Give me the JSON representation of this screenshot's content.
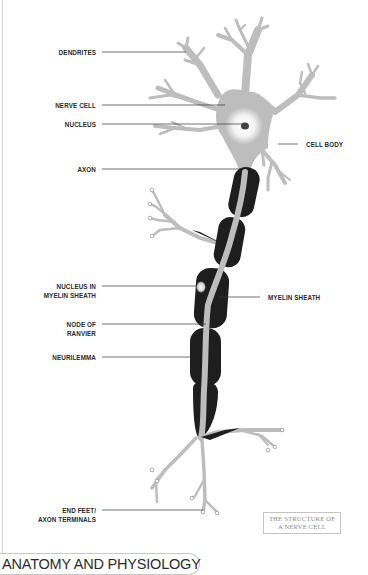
{
  "diagram": {
    "title": "THE STRUCTURE OF A NERVE CELL",
    "caption_lines": [
      "THE STRUCTURE OF",
      "A NERVE CELL"
    ],
    "colors": {
      "cell": "#bdbdbd",
      "cell_outline": "#9a9a9a",
      "myelin": "#1e1e1e",
      "nucleus": "#444444",
      "leader_line": "#333333",
      "text": "#2a2a2a"
    },
    "labels_left": [
      {
        "id": "dendrites",
        "lines": [
          "DENDRITES"
        ]
      },
      {
        "id": "nerve-cell",
        "lines": [
          "NERVE CELL"
        ]
      },
      {
        "id": "nucleus",
        "lines": [
          "NUCLEUS"
        ]
      },
      {
        "id": "axon",
        "lines": [
          "AXON"
        ]
      },
      {
        "id": "nucleus-in-myelin-sheath",
        "lines": [
          "NUCLEUS IN",
          "MYELIN SHEATH"
        ]
      },
      {
        "id": "node-of-ranvier",
        "lines": [
          "NODE OF",
          "RANVIER"
        ]
      },
      {
        "id": "neurilemma",
        "lines": [
          "NEURILEMMA"
        ]
      },
      {
        "id": "end-feet",
        "lines": [
          "END FEET/",
          "AXON TERMINALS"
        ]
      }
    ],
    "labels_right": [
      {
        "id": "cell-body",
        "lines": [
          "CELL BODY"
        ]
      },
      {
        "id": "myelin-sheath",
        "lines": [
          "MYELIN SHEATH"
        ]
      }
    ]
  },
  "footer": {
    "section_title": "ANATOMY AND PHYSIOLOGY"
  }
}
